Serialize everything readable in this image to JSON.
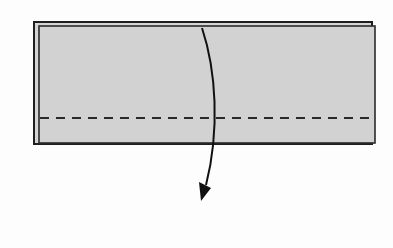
{
  "diagram": {
    "type": "origami-fold-step",
    "colors": {
      "background": "#fdfdfd",
      "paper": "#d2d2d2",
      "outline": "#1e1e1e",
      "fold_line": "#2a2a2a",
      "arrow": "#111111"
    },
    "elements": {
      "paper_back_layer": {
        "x": 34,
        "y": 22,
        "width": 338,
        "height": 122
      },
      "paper_front_layer": {
        "x": 39,
        "y": 26,
        "width": 336,
        "height": 117
      },
      "valley_fold_line": {
        "y": 118,
        "x1": 39,
        "x2": 374,
        "style": "dashed"
      },
      "fold_arrow": {
        "start": [
          202,
          28
        ],
        "end": [
          203,
          200
        ],
        "direction": "down"
      }
    }
  }
}
